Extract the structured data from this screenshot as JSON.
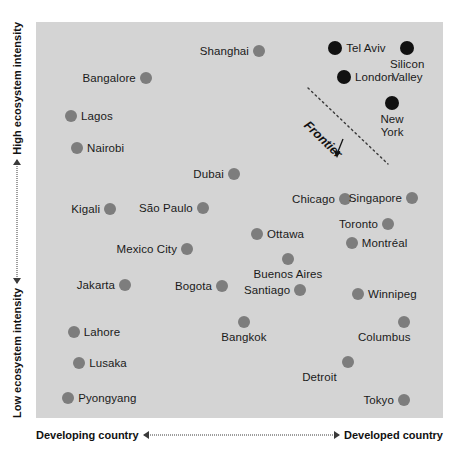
{
  "chart_data": {
    "type": "scatter",
    "title": "",
    "xlabel_left": "Developing country",
    "xlabel_right": "Developed country",
    "ylabel_top": "High ecosystem intensity",
    "ylabel_bottom": "Low ecosystem intensity",
    "xlim": [
      0,
      100
    ],
    "ylim": [
      0,
      100
    ],
    "grid": false,
    "legend": "none",
    "annotation": {
      "text": "Frontier",
      "arrow": "down-arrow-icon",
      "line_from": [
        67.0,
        83.3
      ],
      "line_to": [
        86.5,
        64.1
      ]
    },
    "series": [
      {
        "name": "Standard ecosystems",
        "color": "#7d7d7d",
        "points": [
          {
            "label": "Bangalore",
            "x": 27.0,
            "y": 85.9,
            "label_pos": "left"
          },
          {
            "label": "Shanghai",
            "x": 54.8,
            "y": 92.7,
            "label_pos": "left"
          },
          {
            "label": "Lagos",
            "x": 8.6,
            "y": 76.3,
            "label_pos": "right"
          },
          {
            "label": "Nairobi",
            "x": 10.1,
            "y": 68.2,
            "label_pos": "right"
          },
          {
            "label": "Dubai",
            "x": 48.6,
            "y": 61.6,
            "label_pos": "left"
          },
          {
            "label": "Kigali",
            "x": 18.2,
            "y": 52.8,
            "label_pos": "left"
          },
          {
            "label": "São Paulo",
            "x": 41.0,
            "y": 53.0,
            "label_pos": "left"
          },
          {
            "label": "Chicago",
            "x": 75.9,
            "y": 55.3,
            "label_pos": "left"
          },
          {
            "label": "Singapore",
            "x": 92.4,
            "y": 55.6,
            "label_pos": "left"
          },
          {
            "label": "Toronto",
            "x": 86.5,
            "y": 49.0,
            "label_pos": "left"
          },
          {
            "label": "Mexico City",
            "x": 37.1,
            "y": 42.7,
            "label_pos": "left"
          },
          {
            "label": "Ottawa",
            "x": 54.3,
            "y": 46.5,
            "label_pos": "right"
          },
          {
            "label": "Montréal",
            "x": 77.6,
            "y": 44.2,
            "label_pos": "right"
          },
          {
            "label": "Jakarta",
            "x": 21.9,
            "y": 33.6,
            "label_pos": "left"
          },
          {
            "label": "Bogota",
            "x": 45.7,
            "y": 33.3,
            "label_pos": "left"
          },
          {
            "label": "Buenos Aires",
            "x": 61.9,
            "y": 40.2,
            "label_pos": "below"
          },
          {
            "label": "Santiago",
            "x": 64.9,
            "y": 32.3,
            "label_pos": "left"
          },
          {
            "label": "Winnipeg",
            "x": 79.1,
            "y": 31.3,
            "label_pos": "right"
          },
          {
            "label": "Lahore",
            "x": 9.3,
            "y": 21.7,
            "label_pos": "right"
          },
          {
            "label": "Bangkok",
            "x": 51.1,
            "y": 24.2,
            "label_pos": "below"
          },
          {
            "label": "Columbus",
            "x": 90.4,
            "y": 24.2,
            "label_pos": "belowleft"
          },
          {
            "label": "Lusaka",
            "x": 10.6,
            "y": 13.9,
            "label_pos": "right"
          },
          {
            "label": "Detroit",
            "x": 76.7,
            "y": 14.1,
            "label_pos": "belowleft"
          },
          {
            "label": "Pyongyang",
            "x": 7.9,
            "y": 5.1,
            "label_pos": "right"
          },
          {
            "label": "Tokyo",
            "x": 90.4,
            "y": 4.5,
            "label_pos": "left"
          }
        ]
      },
      {
        "name": "Frontier ecosystems",
        "color": "#111111",
        "points": [
          {
            "label": "Tel Aviv",
            "x": 73.5,
            "y": 93.4,
            "label_pos": "right"
          },
          {
            "label": "Silicon\nValley",
            "x": 91.2,
            "y": 93.4,
            "label_pos": "below"
          },
          {
            "label": "London",
            "x": 75.7,
            "y": 86.1,
            "label_pos": "right"
          },
          {
            "label": "New\nYork",
            "x": 87.5,
            "y": 79.5,
            "label_pos": "below"
          }
        ]
      }
    ]
  },
  "axes": {
    "y_top_label": "High ecosystem intensity",
    "y_bottom_label": "Low ecosystem intensity",
    "x_left_label": "Developing country",
    "x_right_label": "Developed country"
  },
  "colors": {
    "plot_background": "#d4d4d4",
    "page_background": "#ffffff",
    "point_standard": "#7d7d7d",
    "point_frontier": "#111111",
    "text": "#1a1a1a",
    "axis_line": "#3a3a3a"
  },
  "frontier": {
    "label": "Frontier",
    "arrow_glyph": "↓"
  }
}
